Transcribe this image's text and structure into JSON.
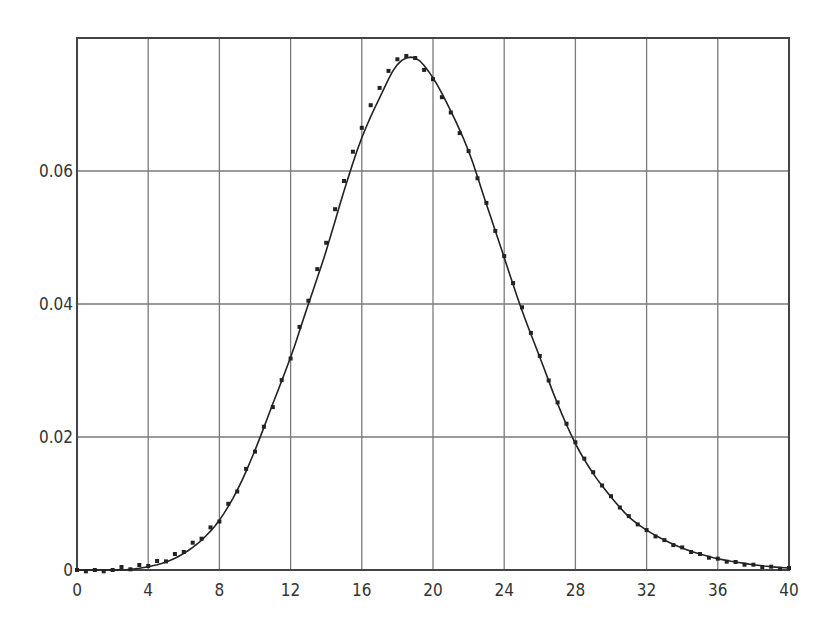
{
  "chart_data": {
    "type": "line",
    "title": "",
    "xlabel": "",
    "ylabel": "",
    "xlim": [
      0,
      40
    ],
    "ylim": [
      0,
      0.08
    ],
    "grid": true,
    "legend": null,
    "x_ticks": [
      "0",
      "4",
      "8",
      "12",
      "16",
      "20",
      "24",
      "28",
      "32",
      "36",
      "40"
    ],
    "y_ticks": [
      "0",
      "0.02",
      "0.04",
      "0.06"
    ],
    "x": [
      0,
      1,
      2,
      3,
      4,
      5,
      6,
      7,
      8,
      9,
      10,
      11,
      12,
      13,
      14,
      15,
      16,
      17,
      18,
      19,
      20,
      21,
      22,
      23,
      24,
      25,
      26,
      27,
      28,
      29,
      30,
      31,
      32,
      33,
      34,
      35,
      36,
      37,
      38,
      39,
      40
    ],
    "series": [
      {
        "name": "density curve",
        "style": "solid line",
        "values": [
          0,
          0,
          0,
          0.0001,
          0.0005,
          0.0012,
          0.0025,
          0.0045,
          0.0075,
          0.012,
          0.018,
          0.025,
          0.032,
          0.04,
          0.048,
          0.057,
          0.065,
          0.071,
          0.076,
          0.077,
          0.074,
          0.069,
          0.063,
          0.055,
          0.047,
          0.039,
          0.032,
          0.025,
          0.019,
          0.0145,
          0.011,
          0.008,
          0.006,
          0.0045,
          0.0033,
          0.0024,
          0.0017,
          0.0012,
          0.0008,
          0.0005,
          0.0003
        ]
      },
      {
        "name": "empirical points",
        "style": "dots",
        "values": [
          0,
          0,
          0,
          0.0001,
          0.0006,
          0.0013,
          0.0027,
          0.0047,
          0.0073,
          0.0118,
          0.0178,
          0.0245,
          0.0318,
          0.0405,
          0.0492,
          0.0585,
          0.0665,
          0.0725,
          0.0768,
          0.077,
          0.0738,
          0.0688,
          0.063,
          0.0552,
          0.0472,
          0.0395,
          0.0322,
          0.0252,
          0.0192,
          0.0147,
          0.0111,
          0.0081,
          0.006,
          0.0045,
          0.0034,
          0.0024,
          0.0017,
          0.0012,
          0.0008,
          0.0005,
          0.0003
        ]
      }
    ]
  },
  "colors": {
    "background": "#ffffff",
    "grid": "#7a7a7a",
    "frame": "#444444",
    "line": "#222222",
    "points": "#222222"
  }
}
